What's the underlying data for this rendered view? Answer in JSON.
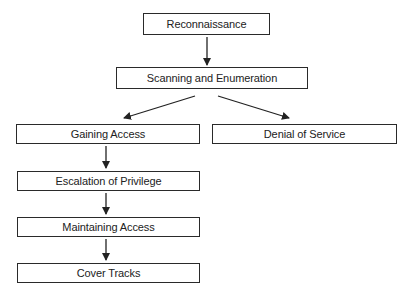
{
  "diagram": {
    "type": "flowchart",
    "nodes": [
      {
        "id": "recon",
        "label": "Reconnaissance"
      },
      {
        "id": "scan",
        "label": "Scanning and Enumeration"
      },
      {
        "id": "gain",
        "label": "Gaining Access"
      },
      {
        "id": "dos",
        "label": "Denial of Service"
      },
      {
        "id": "esc",
        "label": "Escalation of Privilege"
      },
      {
        "id": "maint",
        "label": "Maintaining Access"
      },
      {
        "id": "cover",
        "label": "Cover Tracks"
      }
    ],
    "edges": [
      {
        "from": "recon",
        "to": "scan"
      },
      {
        "from": "scan",
        "to": "gain"
      },
      {
        "from": "scan",
        "to": "dos"
      },
      {
        "from": "gain",
        "to": "esc"
      },
      {
        "from": "esc",
        "to": "maint"
      },
      {
        "from": "maint",
        "to": "cover"
      }
    ],
    "colors": {
      "line": "#2a2a2a",
      "background": "#ffffff"
    }
  }
}
